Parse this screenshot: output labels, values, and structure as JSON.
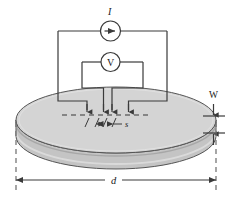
{
  "figure": {
    "type": "schematic-diagram"
  },
  "labels": {
    "current_source": "I",
    "voltmeter": "V",
    "thickness": "W",
    "diameter": "d",
    "probe_spacing": "s"
  },
  "instruments": {
    "ammeter_symbol": "current-source-arrow",
    "voltmeter_symbol": "V"
  },
  "probes": {
    "count": 4,
    "tip_positions_x": [
      95,
      103.5,
      112,
      120.5
    ],
    "tip_y": 113
  },
  "colors": {
    "wafer_top": "#d3d3d3",
    "wafer_edge": "#b0b0b0",
    "wafer_side": "#c2c2c2",
    "line": "#3a3a3a",
    "dashed": "#6e6e6e",
    "text": "#1a1a1a",
    "background": "#ffffff"
  },
  "geometry": {
    "wafer_center_x": 116,
    "wafer_center_y": 120,
    "wafer_rx": 100,
    "wafer_ry": 33,
    "wafer_thickness": 16
  }
}
